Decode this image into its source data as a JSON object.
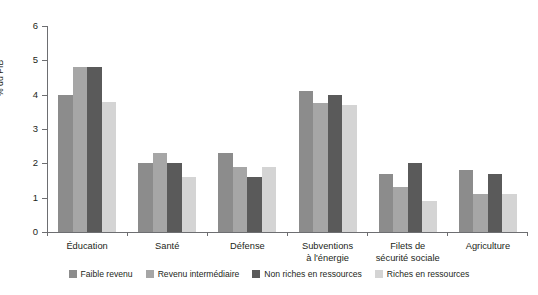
{
  "chart_data": {
    "type": "bar",
    "title": "",
    "subtitle": "",
    "xlabel": "",
    "ylabel": "% du PIB",
    "ylim": [
      0,
      6
    ],
    "yticks": [
      "0",
      "1",
      "2",
      "3",
      "4",
      "5",
      "6"
    ],
    "grid": false,
    "legend_position": "bottom",
    "categories": [
      "Éducation",
      "Santé",
      "Défense",
      "Subventions à l'énergie",
      "Filets de sécurité sociale",
      "Agriculture"
    ],
    "category_lines": [
      [
        "Éducation"
      ],
      [
        "Santé"
      ],
      [
        "Défense"
      ],
      [
        "Subventions",
        "à l'énergie"
      ],
      [
        "Filets de",
        "sécurité sociale"
      ],
      [
        "Agriculture"
      ]
    ],
    "series": [
      {
        "name": "Faible revenu",
        "color": "#8c8c8c",
        "values": [
          4.0,
          2.0,
          2.3,
          4.1,
          1.7,
          1.8
        ]
      },
      {
        "name": "Revenu intermédiaire",
        "color": "#a6a6a6",
        "values": [
          4.8,
          2.3,
          1.9,
          3.75,
          1.3,
          1.1
        ]
      },
      {
        "name": "Non riches en ressources",
        "color": "#5a5a5a",
        "values": [
          4.8,
          2.0,
          1.6,
          4.0,
          2.0,
          1.7
        ]
      },
      {
        "name": "Riches en ressources",
        "color": "#d4d4d4",
        "values": [
          3.8,
          1.6,
          1.9,
          3.7,
          0.9,
          1.1
        ]
      }
    ]
  },
  "colors": {
    "axis": "#6d6e71",
    "text": "#231f20",
    "background": "#ffffff"
  }
}
